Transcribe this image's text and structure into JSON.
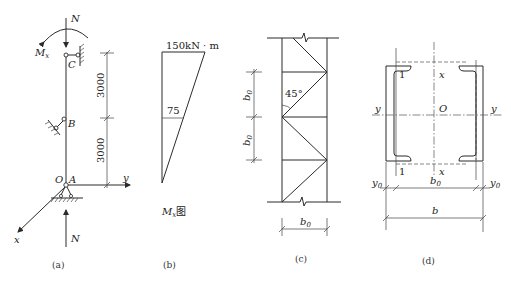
{
  "figure": {
    "panels": [
      {
        "id": "a",
        "caption": "(a)",
        "labels": {
          "axial_force_top": "N",
          "axial_force_bottom": "N",
          "moment": "M",
          "moment_sub": "x",
          "node_top": "C",
          "node_mid": "B",
          "node_bottom": "A",
          "origin": "O",
          "axis_x": "x",
          "axis_y": "y"
        },
        "dimensions": [
          "3000",
          "3000"
        ]
      },
      {
        "id": "b",
        "caption": "(b)",
        "labels": {
          "top_value": "150kN · m",
          "mid_value": "75",
          "title_main": "M",
          "title_sub": "x",
          "title_suffix": "图"
        }
      },
      {
        "id": "c",
        "caption": "(c)",
        "labels": {
          "angle": "45°",
          "dim_top": "b",
          "dim_top_sub": "0",
          "dim_mid": "b",
          "dim_mid_sub": "0",
          "dim_width": "b",
          "dim_width_sub": "0"
        }
      },
      {
        "id": "d",
        "caption": "(d)",
        "labels": {
          "section_marker_top": "1",
          "section_marker_bottom": "1",
          "axis_x_top": "x",
          "axis_x_bottom": "x",
          "axis_y_left": "y",
          "axis_y_right": "y",
          "origin": "O",
          "dim_y0_left": "y",
          "dim_y0_left_sub": "0",
          "dim_b0": "b",
          "dim_b0_sub": "0",
          "dim_y0_right": "y",
          "dim_y0_right_sub": "0",
          "dim_b": "b"
        }
      }
    ]
  }
}
